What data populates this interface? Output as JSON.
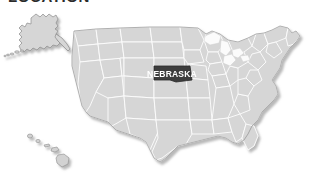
{
  "page": {
    "title": "LOCATION",
    "background_color": "#ffffff"
  },
  "map": {
    "name": "united-states-map",
    "region": "United States of America",
    "projection_note": "Alaska and Hawaii shown as insets",
    "colors": {
      "state_fill": "#d6d6d6",
      "state_border": "#8f8f8f",
      "state_inner_border": "#fdfdfd",
      "highlight_fill": "#3d3d3d",
      "highlight_label": "#ffffff",
      "lake_fill": "#fbfbfb",
      "shadow": "#bcbcbc"
    },
    "highlighted_state": {
      "name": "NEBRASKA",
      "label": "NEBRASKA",
      "label_color": "#ffffff",
      "fill": "#3d3d3d"
    },
    "insets": [
      {
        "name": "Alaska",
        "position": "upper-left"
      },
      {
        "name": "Hawaii",
        "position": "lower-left"
      }
    ],
    "features": [
      "contiguous-united-states",
      "state-boundaries",
      "great-lakes",
      "alaska-inset",
      "hawaii-inset",
      "drop-shadow"
    ]
  }
}
